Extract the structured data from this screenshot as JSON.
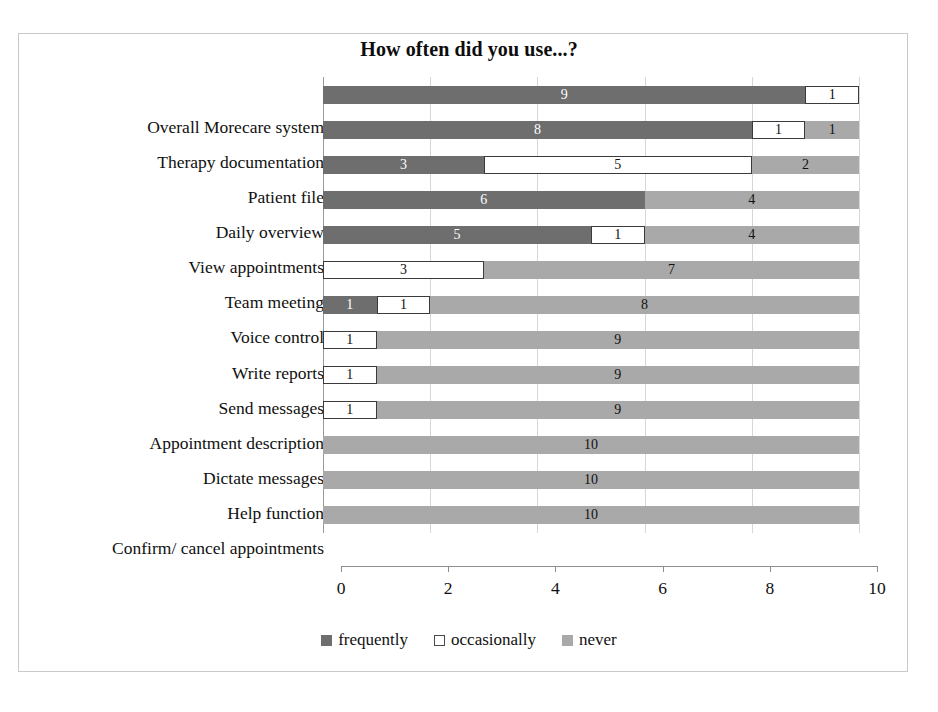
{
  "chart_data": {
    "type": "bar",
    "orientation": "horizontal",
    "stacked": true,
    "title": "How often did you use...?",
    "xlabel": "",
    "ylabel": "",
    "xlim": [
      0,
      10
    ],
    "xticks": [
      0,
      2,
      4,
      6,
      8,
      10
    ],
    "xtick_labels": [
      "0",
      "2",
      "4",
      "6",
      "8",
      "10"
    ],
    "grid": true,
    "grid_axis": "x",
    "legend_position": "bottom",
    "categories": [
      "Overall Morecare system",
      "Therapy documentation",
      "Patient file",
      "Daily overview",
      "View appointments",
      "Team meeting",
      "Voice control",
      "Write reports",
      "Send messages",
      "Appointment description",
      "Dictate messages",
      "Help function",
      "Confirm/ cancel appointments"
    ],
    "series": [
      {
        "name": "frequently",
        "color": "#6e6e6e",
        "values": [
          9,
          8,
          3,
          6,
          5,
          0,
          1,
          0,
          0,
          0,
          0,
          0,
          0
        ]
      },
      {
        "name": "occasionally",
        "color": "#ffffff",
        "values": [
          1,
          1,
          5,
          0,
          1,
          3,
          1,
          1,
          1,
          1,
          0,
          0,
          0
        ]
      },
      {
        "name": "never",
        "color": "#a9a9a9",
        "values": [
          0,
          1,
          2,
          4,
          4,
          7,
          8,
          9,
          9,
          9,
          10,
          10,
          10
        ]
      }
    ],
    "bar_labels": [
      [
        "9",
        "1",
        ""
      ],
      [
        "8",
        "1",
        "1"
      ],
      [
        "3",
        "5",
        "2"
      ],
      [
        "6",
        "",
        "4"
      ],
      [
        "5",
        "1",
        "4"
      ],
      [
        "",
        "3",
        "7"
      ],
      [
        "1",
        "1",
        "8"
      ],
      [
        "",
        "1",
        "9"
      ],
      [
        "",
        "1",
        "9"
      ],
      [
        "",
        "1",
        "9"
      ],
      [
        "",
        "",
        "10"
      ],
      [
        "",
        "",
        "10"
      ],
      [
        "",
        "",
        "10"
      ]
    ]
  },
  "legend": {
    "items": [
      {
        "label": "frequently"
      },
      {
        "label": "occasionally"
      },
      {
        "label": "never"
      }
    ]
  }
}
